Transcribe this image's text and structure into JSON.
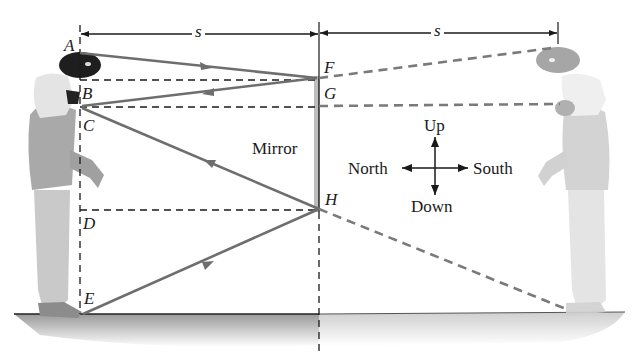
{
  "figure": {
    "dimension_labels": {
      "left_distance": "s",
      "right_distance": "s"
    },
    "points": {
      "A": "A",
      "B": "B",
      "C": "C",
      "D": "D",
      "E": "E",
      "F": "F",
      "G": "G",
      "H": "H"
    },
    "mirror_label": "Mirror",
    "compass": {
      "up": "Up",
      "down": "Down",
      "north": "North",
      "south": "South"
    },
    "colors": {
      "ray": "#6e6e6e",
      "dashed_construction": "#2a2a2a",
      "virtual_ray": "#7a7a7a",
      "mirror": "#bdbdbd",
      "ground_shadow": "#b5b5b5",
      "person": "#9a9a9a",
      "image_person": "#c8c8c8"
    }
  }
}
